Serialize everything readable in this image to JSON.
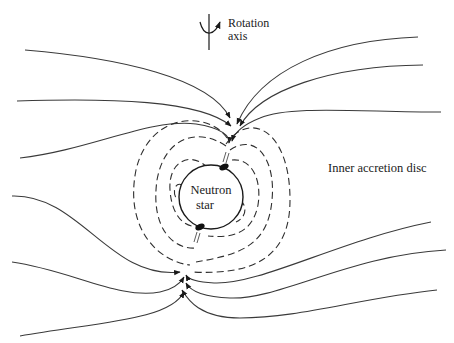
{
  "figure": {
    "labels": {
      "rotation_axis_line1": "Rotation",
      "rotation_axis_line2": "axis",
      "inner_disc": "Inner accretion disc",
      "star_line1": "Neutron",
      "star_line2": "star"
    },
    "colors": {
      "background": "#ffffff",
      "line": "#3a3a3a",
      "text": "#1a1a1a",
      "polar_cap": "#111111"
    },
    "elements": {
      "star": {
        "cx": 211,
        "cy": 197,
        "r": 32
      },
      "rotation_axis": {
        "x": 209,
        "y_top": 16,
        "y_bottom": 50
      },
      "solid_field_lines": 12,
      "dashed_closed_loops": 8,
      "polar_caps": [
        "north-east",
        "south-west"
      ],
      "accretion_flow_arrows": "converging on magnetic poles"
    }
  }
}
